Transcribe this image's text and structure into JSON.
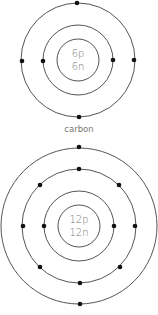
{
  "atoms": [
    {
      "name": "carbon",
      "label": "carbon",
      "nucleus": {
        "protons": "6p",
        "neutrons": "6n"
      },
      "center": [
        78,
        60
      ],
      "nucleus_radius": 21,
      "shells": [
        {
          "radius": 35,
          "electrons": 2
        },
        {
          "radius": 57,
          "electrons": 4
        }
      ]
    },
    {
      "name": "magnesium",
      "label": "",
      "nucleus": {
        "protons": "12p",
        "neutrons": "12n"
      },
      "center": [
        79,
        226
      ],
      "nucleus_radius": 21,
      "shells": [
        {
          "radius": 35,
          "electrons": 2
        },
        {
          "radius": 57,
          "electrons": 8
        },
        {
          "radius": 78,
          "electrons": 2
        }
      ]
    }
  ],
  "colors": {
    "ring": "#555555",
    "electron": "#111111",
    "text": "#777777"
  }
}
